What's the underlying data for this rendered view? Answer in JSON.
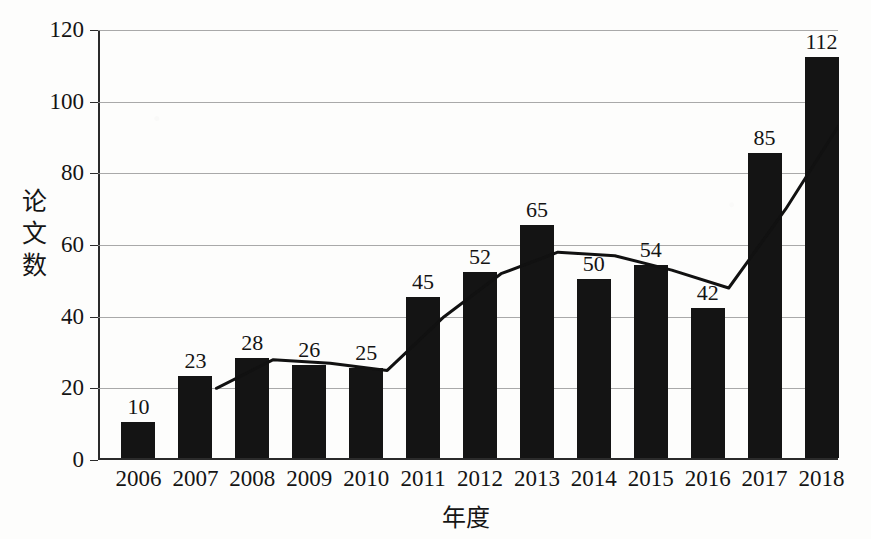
{
  "chart_data": {
    "type": "bar",
    "title": "",
    "xlabel": "年度",
    "ylabel": "论文数",
    "categories": [
      "2006",
      "2007",
      "2008",
      "2009",
      "2010",
      "2011",
      "2012",
      "2013",
      "2014",
      "2015",
      "2016",
      "2017",
      "2018"
    ],
    "values": [
      10,
      23,
      28,
      26,
      25,
      45,
      52,
      65,
      50,
      54,
      42,
      85,
      112
    ],
    "series": [
      {
        "name": "论文数",
        "type": "bar",
        "values": [
          10,
          23,
          28,
          26,
          25,
          45,
          52,
          65,
          50,
          54,
          42,
          85,
          112
        ]
      },
      {
        "name": "趋势线",
        "type": "line",
        "x": [
          "2007",
          "2008",
          "2009",
          "2010",
          "2011",
          "2012",
          "2013",
          "2014",
          "2015",
          "2016",
          "2017",
          "2018"
        ],
        "values": [
          20,
          28,
          27,
          25,
          40,
          52,
          58,
          57,
          53,
          48,
          70,
          95
        ]
      }
    ],
    "ylim": [
      0,
      120
    ],
    "yticks": [
      0,
      20,
      40,
      60,
      80,
      100,
      120
    ],
    "ytick_labels": [
      "0",
      "20",
      "40",
      "60",
      "80",
      "100",
      "120"
    ],
    "grid": true,
    "legend": "none",
    "bar_color": "#141414",
    "line_color": "#111111",
    "grid_color": "#9a9a9a",
    "axis_color": "#2b2b2b",
    "background": "#fdfdfc"
  },
  "axis": {
    "ylabel_chars": [
      "论",
      "文",
      "数"
    ],
    "xlabel_text": "年度"
  }
}
